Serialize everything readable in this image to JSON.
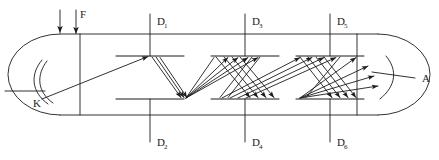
{
  "figure": {
    "type": "process-equipment-schematic",
    "background_color": "#ffffff",
    "line_color": "#1b1b1b",
    "width": 439,
    "height": 160
  },
  "labels": {
    "feed": "F",
    "left_annotation": "K",
    "right_annotation": "A",
    "distributors": [
      {
        "id": "D1",
        "letter": "D",
        "subscript": "1",
        "position": "top"
      },
      {
        "id": "D2",
        "letter": "D",
        "subscript": "2",
        "position": "bottom"
      },
      {
        "id": "D3",
        "letter": "D",
        "subscript": "3",
        "position": "top"
      },
      {
        "id": "D4",
        "letter": "D",
        "subscript": "4",
        "position": "bottom"
      },
      {
        "id": "D5",
        "letter": "D",
        "subscript": "5",
        "position": "top"
      },
      {
        "id": "D6",
        "letter": "D",
        "subscript": "6",
        "position": "bottom"
      }
    ]
  },
  "geometry": {
    "vessel": {
      "body_left": 60,
      "body_right": 378,
      "top": 34,
      "bottom": 115,
      "cap_radius_x": 52,
      "left_divider_x": 80,
      "right_divider_x": 357
    },
    "trays": {
      "upper_y": 56,
      "lower_y": 99,
      "upper_x": [
        150,
        245,
        330
      ],
      "lower_x": [
        150,
        245,
        330
      ],
      "half_width": 34
    },
    "nozzles": {
      "top_x": [
        150,
        245,
        330
      ],
      "bottom_x": [
        150,
        245,
        330
      ],
      "top_stub_y": 14,
      "bottom_stub_y": 140
    },
    "feed_arrows": {
      "x": [
        60,
        76
      ],
      "y_start": 10,
      "y_end": 33
    }
  },
  "colors": {
    "stroke": "#1b1b1b",
    "text": "#1b1b1b",
    "background": "#ffffff"
  }
}
